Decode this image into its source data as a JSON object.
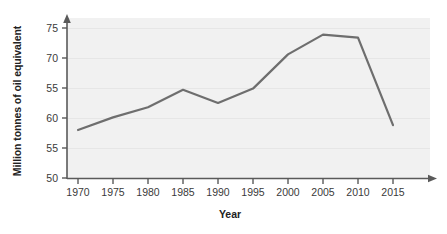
{
  "chart_data": {
    "type": "line",
    "title": "",
    "xlabel": "Year",
    "ylabel": "Million tonnes of oil equivalent",
    "x": [
      1970,
      1975,
      1980,
      1985,
      1990,
      1995,
      2000,
      2005,
      2010,
      2015
    ],
    "xtick_labels": [
      "1970",
      "1975",
      "1980",
      "1985",
      "1990",
      "1995",
      "2000",
      "2005",
      "2010",
      "2015"
    ],
    "ytick_labels": [
      "75",
      "70",
      "55",
      "60",
      "55",
      "50"
    ],
    "ytick_values": [
      75,
      70,
      65,
      60,
      55,
      50
    ],
    "ylim": [
      50,
      77
    ],
    "xlim": [
      1968,
      2018
    ],
    "grid": true,
    "legend": false,
    "series": [
      {
        "name": "Million tonnes of oil equivalent",
        "color": "#6e6e6e",
        "values": [
          58.0,
          60.1,
          61.8,
          64.7,
          62.5,
          64.9,
          70.6,
          73.9,
          73.4,
          58.8
        ]
      }
    ],
    "annotations": [],
    "axis_arrows": true,
    "plot_background": "#f1f1f1",
    "gridline_color": "#e6e6e6",
    "axis_color": "#5a5a5a",
    "line_width": 2.2
  }
}
